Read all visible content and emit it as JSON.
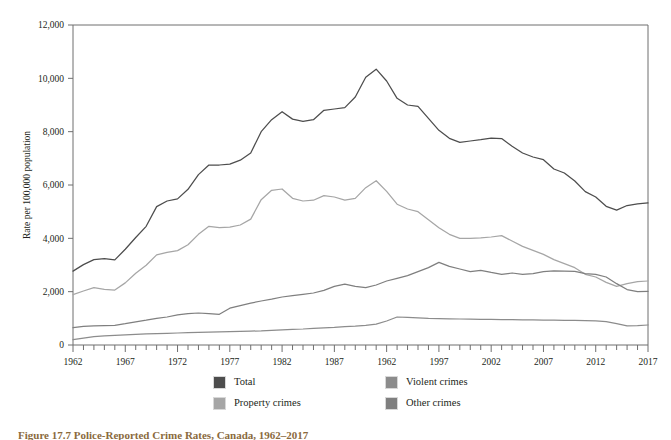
{
  "figure": {
    "caption": "Figure 17.7 Police-Reported Crime Rates, Canada, 1962–2017",
    "caption_color": "#8a6a3d"
  },
  "chart_data": {
    "type": "line",
    "title": "",
    "xlabel": "",
    "ylabel": "Rate per 100,000 population",
    "xlim": [
      1962,
      2017
    ],
    "ylim": [
      0,
      12000
    ],
    "yticks": [
      0,
      2000,
      4000,
      6000,
      8000,
      10000,
      12000
    ],
    "ytick_labels": [
      "0",
      "2,000",
      "4,000",
      "6,000",
      "8,000",
      "10,000",
      "12,000"
    ],
    "xtick_labels": [
      "1962",
      "1967",
      "1972",
      "1977",
      "1982",
      "1987",
      "1962",
      "1997",
      "2002",
      "2007",
      "2012",
      "2017"
    ],
    "xtick_values": [
      1962,
      1967,
      1972,
      1977,
      1982,
      1987,
      1992,
      1997,
      2002,
      2007,
      2012,
      2017
    ],
    "minor_tick_interval": 1,
    "grid": false,
    "legend_position": "bottom",
    "x": [
      1962,
      1963,
      1964,
      1965,
      1966,
      1967,
      1968,
      1969,
      1970,
      1971,
      1972,
      1973,
      1974,
      1975,
      1976,
      1977,
      1978,
      1979,
      1980,
      1981,
      1982,
      1983,
      1984,
      1985,
      1986,
      1987,
      1988,
      1989,
      1990,
      1991,
      1992,
      1993,
      1994,
      1995,
      1996,
      1997,
      1998,
      1999,
      2000,
      2001,
      2002,
      2003,
      2004,
      2005,
      2006,
      2007,
      2008,
      2009,
      2010,
      2011,
      2012,
      2013,
      2014,
      2015,
      2016,
      2017
    ],
    "series": [
      {
        "name": "Total",
        "color": "#4d4d4d",
        "values": [
          2771,
          3015,
          3200,
          3240,
          3190,
          3590,
          4030,
          4450,
          5190,
          5400,
          5480,
          5840,
          6390,
          6750,
          6750,
          6780,
          6930,
          7200,
          8000,
          8450,
          8750,
          8470,
          8390,
          8450,
          8800,
          8850,
          8900,
          9300,
          10040,
          10342,
          9900,
          9250,
          9000,
          8950,
          8500,
          8050,
          7750,
          7600,
          7650,
          7700,
          7760,
          7740,
          7450,
          7200,
          7050,
          6950,
          6600,
          6450,
          6150,
          5750,
          5550,
          5200,
          5060,
          5230,
          5290,
          5330
        ]
      },
      {
        "name": "Property crimes",
        "color": "#a6a6a6",
        "values": [
          1891,
          2025,
          2150,
          2090,
          2060,
          2330,
          2690,
          2990,
          3380,
          3470,
          3540,
          3760,
          4150,
          4450,
          4400,
          4420,
          4500,
          4720,
          5450,
          5800,
          5850,
          5500,
          5400,
          5430,
          5600,
          5550,
          5430,
          5500,
          5900,
          6160,
          5760,
          5280,
          5100,
          5000,
          4700,
          4400,
          4150,
          4000,
          4000,
          4020,
          4050,
          4100,
          3900,
          3700,
          3550,
          3400,
          3200,
          3050,
          2900,
          2650,
          2550,
          2350,
          2200,
          2300,
          2380,
          2400
        ]
      },
      {
        "name": "Violent crimes",
        "color": "#7f7f7f",
        "values": [
          650,
          700,
          720,
          730,
          740,
          800,
          870,
          930,
          1000,
          1050,
          1130,
          1180,
          1200,
          1180,
          1150,
          1380,
          1480,
          1570,
          1650,
          1720,
          1800,
          1850,
          1900,
          1950,
          2050,
          2200,
          2280,
          2200,
          2150,
          2250,
          2400,
          2500,
          2600,
          2750,
          2900,
          3100,
          2950,
          2850,
          2750,
          2800,
          2720,
          2650,
          2700,
          2650,
          2680,
          2750,
          2780,
          2770,
          2760,
          2680,
          2650,
          2550,
          2300,
          2080,
          2000,
          2010
        ]
      },
      {
        "name": "Other crimes",
        "color": "#8c8c8c",
        "values": [
          200,
          260,
          310,
          340,
          360,
          380,
          400,
          420,
          430,
          440,
          450,
          460,
          470,
          480,
          490,
          500,
          510,
          520,
          530,
          550,
          570,
          590,
          600,
          620,
          640,
          660,
          690,
          710,
          740,
          780,
          900,
          1050,
          1040,
          1020,
          1000,
          990,
          980,
          975,
          970,
          965,
          960,
          955,
          950,
          945,
          940,
          935,
          930,
          925,
          920,
          915,
          905,
          880,
          800,
          720,
          730,
          750
        ]
      }
    ]
  },
  "legend": {
    "items": [
      {
        "label": "Total",
        "color": "#4d4d4d"
      },
      {
        "label": "Violent crimes",
        "color": "#8c8c8c"
      },
      {
        "label": "Property crimes",
        "color": "#a6a6a6"
      },
      {
        "label": "Other crimes",
        "color": "#7f7f7f"
      }
    ]
  }
}
